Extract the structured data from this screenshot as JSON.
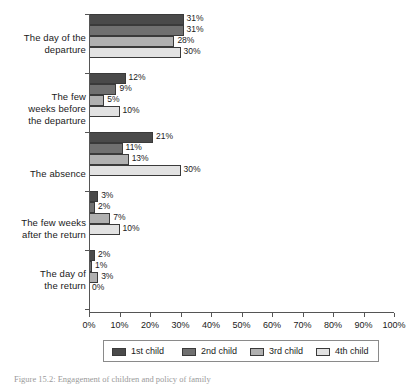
{
  "chart_data": {
    "type": "bar",
    "orientation": "horizontal",
    "title": "",
    "subtitle": "",
    "xlabel": "",
    "ylabel": "",
    "xlim": [
      0,
      100
    ],
    "xtick_labels": [
      "0%",
      "10%",
      "20%",
      "30%",
      "40%",
      "50%",
      "60%",
      "70%",
      "80%",
      "90%",
      "100%"
    ],
    "xtick_values": [
      0,
      10,
      20,
      30,
      40,
      50,
      60,
      70,
      80,
      90,
      100
    ],
    "grid": false,
    "legend_position": "bottom",
    "value_label_suffix": "%",
    "categories": [
      "The day of the departure",
      "The few weeks before the departure",
      "The absence",
      "The few weeks after the return",
      "The day of the return"
    ],
    "category_label_lines": [
      [
        "The day of the",
        "departure"
      ],
      [
        "The few",
        "weeks before",
        "the departure"
      ],
      [
        "The absence"
      ],
      [
        "The few weeks",
        "after the return"
      ],
      [
        "The day of",
        "the return"
      ]
    ],
    "series": [
      {
        "name": "1st child",
        "color": "#4a4a4a",
        "values": [
          31,
          12,
          21,
          3,
          2
        ],
        "labels": [
          "31%",
          "12%",
          "21%",
          "3%",
          "2%"
        ]
      },
      {
        "name": "2nd child",
        "color": "#707070",
        "values": [
          31,
          9,
          11,
          2,
          1
        ],
        "labels": [
          "31%",
          "9%",
          "11%",
          "2%",
          "1%"
        ]
      },
      {
        "name": "3rd child",
        "color": "#b0b0b0",
        "values": [
          28,
          5,
          13,
          7,
          3
        ],
        "labels": [
          "28%",
          "5%",
          "13%",
          "7%",
          "3%"
        ]
      },
      {
        "name": "4th child",
        "color": "#e2e2e2",
        "values": [
          30,
          10,
          30,
          10,
          0
        ],
        "labels": [
          "30%",
          "10%",
          "30%",
          "10%",
          "0%"
        ]
      }
    ]
  },
  "legend": {
    "entries": [
      {
        "label": "1st child",
        "color": "#4a4a4a"
      },
      {
        "label": "2nd child",
        "color": "#707070"
      },
      {
        "label": "3rd child",
        "color": "#b0b0b0"
      },
      {
        "label": "4th child",
        "color": "#e2e2e2"
      }
    ]
  },
  "caption": {
    "text": "Figure 15.2: Engagement of children and policy of family"
  }
}
